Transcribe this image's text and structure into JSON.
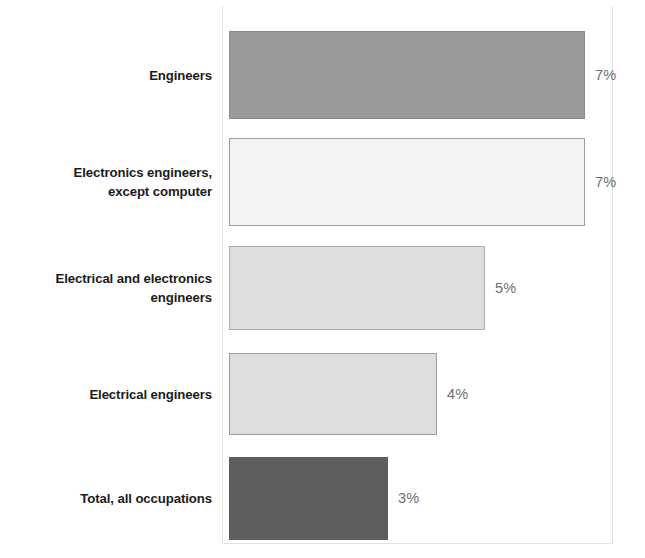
{
  "chart_data": {
    "type": "bar",
    "orientation": "horizontal",
    "title": "",
    "xlabel": "",
    "ylabel": "",
    "grid": false,
    "legend": false,
    "value_suffix": "%",
    "xlim": [
      0,
      7
    ],
    "categories": [
      "Engineers",
      "Electronics engineers, except computer",
      "Electrical and electronics engineers",
      "Electrical engineers",
      "Total, all occupations"
    ],
    "values": [
      7,
      7,
      5,
      4,
      3
    ],
    "value_labels": [
      "7%",
      "7%",
      "5%",
      "4%",
      "3%"
    ],
    "bar_colors": [
      "#9a9a9a",
      "#f3f3f1",
      "#dddddb",
      "#dddddb",
      "#5e5e5e"
    ],
    "bar_border_colors": [
      "#8a8a8a",
      "#9d9d9b",
      "#adadab",
      "#9d9d9b",
      "#5e5e5e"
    ]
  },
  "bars": [
    {
      "label_line1": "Engineers",
      "label_line2": "",
      "value_label": "7%",
      "value": 7,
      "fill": "#9a9a9a",
      "border": "#8a8a8a",
      "top": 31,
      "height": 88,
      "width": 356
    },
    {
      "label_line1": "Electronics engineers,",
      "label_line2": "except computer",
      "value_label": "7%",
      "value": 7,
      "fill": "#f3f3f1",
      "border": "#9d9d9b",
      "top": 138,
      "height": 88,
      "width": 356
    },
    {
      "label_line1": "Electrical and electronics",
      "label_line2": "engineers",
      "value_label": "5%",
      "value": 5,
      "fill": "#dddddb",
      "border": "#adadab",
      "top": 246,
      "height": 84,
      "width": 256
    },
    {
      "label_line1": "Electrical engineers",
      "label_line2": "",
      "value_label": "4%",
      "value": 4,
      "fill": "#dddddb",
      "border": "#9d9d9b",
      "top": 353,
      "height": 82,
      "width": 208
    },
    {
      "label_line1": "Total, all occupations",
      "label_line2": "",
      "value_label": "3%",
      "value": 3,
      "fill": "#5e5e5e",
      "border": "#5e5e5e",
      "top": 457,
      "height": 83,
      "width": 159
    }
  ]
}
